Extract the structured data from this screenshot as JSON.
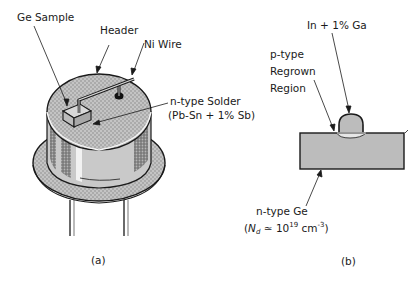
{
  "figure_a": {
    "caption": "(a)",
    "labels": {
      "ge_sample": "Ge Sample",
      "header": "Header",
      "ni_wire": "Ni Wire",
      "solder_line1": "n-type Solder",
      "solder_line2": "(Pb-Sn + 1% Sb)"
    }
  },
  "figure_b": {
    "caption": "(b)",
    "labels": {
      "dopant": "In + 1% Ga",
      "regrown_line1": "p-type",
      "regrown_line2": "Regrown",
      "regrown_line3": "Region",
      "substrate_line1": "n-type  Ge",
      "substrate_open": "(",
      "substrate_N": "N",
      "substrate_d": "d",
      "substrate_approx": " ≃ 10",
      "substrate_exp": "19",
      "substrate_unit": " cm",
      "substrate_unit_exp": "-3",
      "substrate_close": ")"
    }
  },
  "colors": {
    "line": "#1a1a1a",
    "fill_gray": "#bdbdbd",
    "fill_light": "#d0d0d0",
    "fill_dark": "#8a8a8a"
  }
}
